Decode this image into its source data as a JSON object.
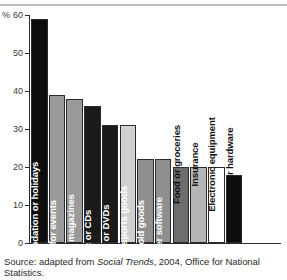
{
  "chart_data": {
    "type": "bar",
    "title": "",
    "subtitle": "",
    "xlabel": "",
    "ylabel": "%",
    "ylim": [
      0,
      60
    ],
    "yticks": [
      0,
      10,
      20,
      30,
      40,
      50,
      60
    ],
    "ytick_labels": [
      "0",
      "10",
      "20",
      "30",
      "40",
      "50",
      "60"
    ],
    "grid": false,
    "legend": "none",
    "categories": [
      "Travel, accommodation or holidays",
      "Tickets for events",
      "Books or magazines",
      "Music or CDs",
      "Videos or DVDs",
      "Clothes or sports goods",
      "Household goods",
      "Computer software",
      "Food or groceries",
      "Insurance",
      "Electronic equipment",
      "Computer hardware"
    ],
    "values": [
      59,
      39,
      38,
      36,
      31,
      31,
      22,
      22,
      20,
      20,
      20,
      18
    ],
    "bar_colors": [
      "#0d0d0d",
      "#9a9a9a",
      "#9a9a9a",
      "#1a1a1a",
      "#1a1a1a",
      "#d0d0d0",
      "#8f8f8f",
      "#8f8f8f",
      "#6e6e6e",
      "#b5b5b5",
      "#ffffff",
      "#0d0d0d"
    ],
    "bars": [
      {
        "label": "Travel, accommodation or holidays",
        "value": 59,
        "color": "#0d0d0d",
        "label_placement": "inside",
        "label_color": "white"
      },
      {
        "label": "Tickets for events",
        "value": 39,
        "color": "#9a9a9a",
        "label_placement": "inside",
        "label_color": "white"
      },
      {
        "label": "Books or magazines",
        "value": 38,
        "color": "#9a9a9a",
        "label_placement": "inside",
        "label_color": "white"
      },
      {
        "label": "Music or CDs",
        "value": 36,
        "color": "#1a1a1a",
        "label_placement": "inside",
        "label_color": "white"
      },
      {
        "label": "Videos or DVDs",
        "value": 31,
        "color": "#1a1a1a",
        "label_placement": "inside",
        "label_color": "white"
      },
      {
        "label": "Clothes or sports goods",
        "value": 31,
        "color": "#d0d0d0",
        "label_placement": "inside",
        "label_color": "white"
      },
      {
        "label": "Household goods",
        "value": 22,
        "color": "#8f8f8f",
        "label_placement": "inside",
        "label_color": "white"
      },
      {
        "label": "Computer software",
        "value": 22,
        "color": "#8f8f8f",
        "label_placement": "inside",
        "label_color": "white"
      },
      {
        "label": "Food or groceries",
        "value": 20,
        "color": "#6e6e6e",
        "label_placement": "outside",
        "label_color": "dark"
      },
      {
        "label": "Insurance",
        "value": 20,
        "color": "#b5b5b5",
        "label_placement": "outside",
        "label_color": "dark"
      },
      {
        "label": "Electronic equipment",
        "value": 20,
        "color": "#ffffff",
        "label_placement": "outside",
        "label_color": "dark"
      },
      {
        "label": "Computer hardware",
        "value": 18,
        "color": "#0d0d0d",
        "label_placement": "outside",
        "label_color": "dark"
      }
    ]
  },
  "axis": {
    "unit_label": "%"
  },
  "source": {
    "prefix": "Source: adapted from ",
    "publication": "Social Trends",
    "suffix": ", 2004, Office for National Statistics."
  }
}
